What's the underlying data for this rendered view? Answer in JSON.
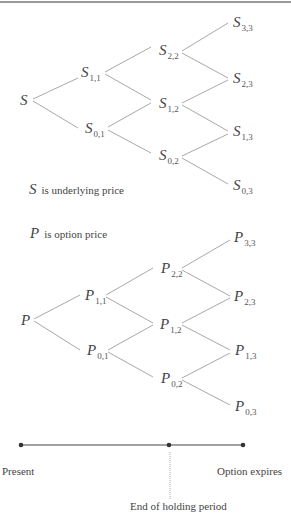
{
  "diagram": {
    "underlying_tree": {
      "root": {
        "sym": "S",
        "sub": ""
      },
      "nodes": [
        {
          "id": "s11",
          "sym": "S",
          "sub": "1,1"
        },
        {
          "id": "s01",
          "sym": "S",
          "sub": "0,1"
        },
        {
          "id": "s22",
          "sym": "S",
          "sub": "2,2"
        },
        {
          "id": "s12",
          "sym": "S",
          "sub": "1,2"
        },
        {
          "id": "s02",
          "sym": "S",
          "sub": "0,2"
        },
        {
          "id": "s33",
          "sym": "S",
          "sub": "3,3"
        },
        {
          "id": "s23",
          "sym": "S",
          "sub": "2,3"
        },
        {
          "id": "s13",
          "sym": "S",
          "sub": "1,3"
        },
        {
          "id": "s03",
          "sym": "S",
          "sub": "0,3"
        }
      ]
    },
    "option_tree": {
      "root": {
        "sym": "P",
        "sub": ""
      },
      "nodes": [
        {
          "id": "p11",
          "sym": "P",
          "sub": "1,1"
        },
        {
          "id": "p01",
          "sym": "P",
          "sub": "0,1"
        },
        {
          "id": "p22",
          "sym": "P",
          "sub": "2,2"
        },
        {
          "id": "p12",
          "sym": "P",
          "sub": "1,2"
        },
        {
          "id": "p02",
          "sym": "P",
          "sub": "0,2"
        },
        {
          "id": "p33",
          "sym": "P",
          "sub": "3,3"
        },
        {
          "id": "p23",
          "sym": "P",
          "sub": "2,3"
        },
        {
          "id": "p13",
          "sym": "P",
          "sub": "1,3"
        },
        {
          "id": "p03",
          "sym": "P",
          "sub": "0,3"
        }
      ]
    },
    "legend": {
      "s": {
        "sym": "S",
        "text": "is underlying price"
      },
      "p": {
        "sym": "P",
        "text": "is option price"
      }
    },
    "timeline": {
      "present": "Present",
      "holding": "End of holding period",
      "expires": "Option expires"
    },
    "colors": {
      "line": "#9a9a9a",
      "timeline": "#333333",
      "text": "#444444"
    }
  }
}
